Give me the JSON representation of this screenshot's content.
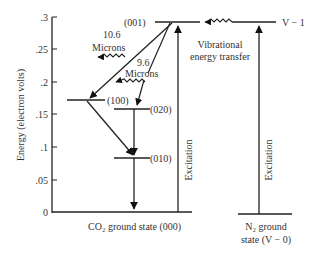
{
  "diagram": {
    "type": "energy-level-diagram",
    "y_axis": {
      "label": "Energy (electron volts)",
      "ticks": [
        ".3",
        ".25",
        ".2",
        ".15",
        ".1",
        ".05",
        "0"
      ]
    },
    "co2_levels": {
      "l001": "(001)",
      "l100": "(100)",
      "l020": "(020)",
      "l010": "(010)",
      "ground": "CO₂ ground state (000)"
    },
    "transitions": {
      "t106_line1": "10.6",
      "t106_line2": "Microns",
      "t96_line1": "9.6",
      "t96_line2": "Microns"
    },
    "n2": {
      "upper": "V − 1",
      "ground_line1": "N₂ ground",
      "ground_line2": "state (V − 0)"
    },
    "transfer": {
      "line1": "Vibrational",
      "line2": "energy transfer"
    },
    "excitation_co2": "Excitation",
    "excitation_n2": "Excitation"
  }
}
